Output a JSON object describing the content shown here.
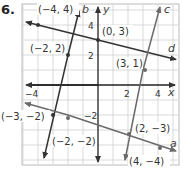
{
  "problem_number": "6.",
  "axes": {
    "x_label": "x",
    "y_label": "y",
    "x_ticks": [
      "−4",
      "2",
      "4"
    ],
    "y_ticks": [
      "4",
      "2",
      "−2"
    ],
    "x_range": [
      -5,
      5
    ],
    "y_range": [
      -5,
      5
    ]
  },
  "lines": [
    {
      "name": "a",
      "color": "#6b6b6b",
      "points": [
        "(−2, −2)",
        "(2, −3)",
        "(4, −4)"
      ]
    },
    {
      "name": "b",
      "color": "#333333",
      "points": [
        "(−2, 2)",
        "(−3, −2)"
      ]
    },
    {
      "name": "c",
      "color": "#6b6b6b",
      "points": [
        "(3, 1)",
        "(2, −3)"
      ]
    },
    {
      "name": "d",
      "color": "#333333",
      "points": [
        "(−4, 4)",
        "(0, 3)"
      ]
    }
  ],
  "point_labels": {
    "p1": "(−4, 4)",
    "p2": "(0, 3)",
    "p3": "(−2, 2)",
    "p4": "(3, 1)",
    "p5": "(−3, −2)",
    "p6": "(−2, −2)",
    "p7": "(2, −3)",
    "p8": "(4, −4)"
  }
}
